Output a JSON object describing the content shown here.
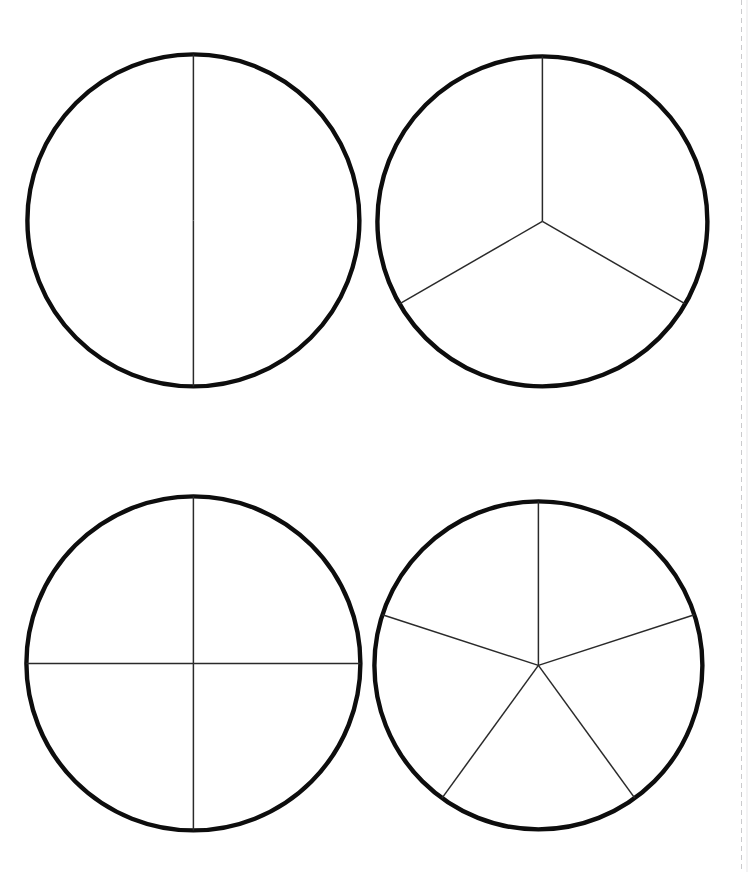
{
  "document": {
    "title": "Fraction Circles",
    "page_background": "#ffffff",
    "width": 748,
    "height": 872
  },
  "style": {
    "outline_color": "#0d0d0d",
    "outline_width": 4.4,
    "divider_color": "#2a2a2a",
    "divider_width": 1.5,
    "fill_color": "#ffffff"
  },
  "chart_data": {
    "type": "pie",
    "xlabel": "",
    "ylabel": "",
    "legend": "none",
    "grid": false,
    "charts": [
      {
        "name": "halves",
        "label": "1/2",
        "slices": 2,
        "values": [
          50,
          50
        ],
        "categories": [
          "1/2",
          "1/2"
        ],
        "start_angle_deg": 90,
        "center_x": 193,
        "center_y": 220,
        "radius": 166,
        "divider_angles_deg": [
          90,
          270
        ]
      },
      {
        "name": "thirds",
        "label": "1/3",
        "slices": 3,
        "values": [
          33.3,
          33.3,
          33.3
        ],
        "categories": [
          "1/3",
          "1/3",
          "1/3"
        ],
        "start_angle_deg": 90,
        "center_x": 542,
        "center_y": 221,
        "radius": 165,
        "divider_angles_deg": [
          90,
          210,
          330
        ]
      },
      {
        "name": "quarters",
        "label": "1/4",
        "slices": 4,
        "values": [
          25,
          25,
          25,
          25
        ],
        "categories": [
          "1/4",
          "1/4",
          "1/4",
          "1/4"
        ],
        "start_angle_deg": 90,
        "center_x": 193,
        "center_y": 663,
        "radius": 167,
        "divider_angles_deg": [
          90,
          180,
          270,
          360
        ]
      },
      {
        "name": "fifths",
        "label": "1/5",
        "slices": 5,
        "values": [
          20,
          20,
          20,
          20,
          20
        ],
        "categories": [
          "1/5",
          "1/5",
          "1/5",
          "1/5",
          "1/5"
        ],
        "start_angle_deg": 90,
        "center_x": 538,
        "center_y": 665,
        "radius": 164,
        "divider_angles_deg": [
          90,
          162,
          234,
          306,
          18
        ]
      }
    ]
  }
}
